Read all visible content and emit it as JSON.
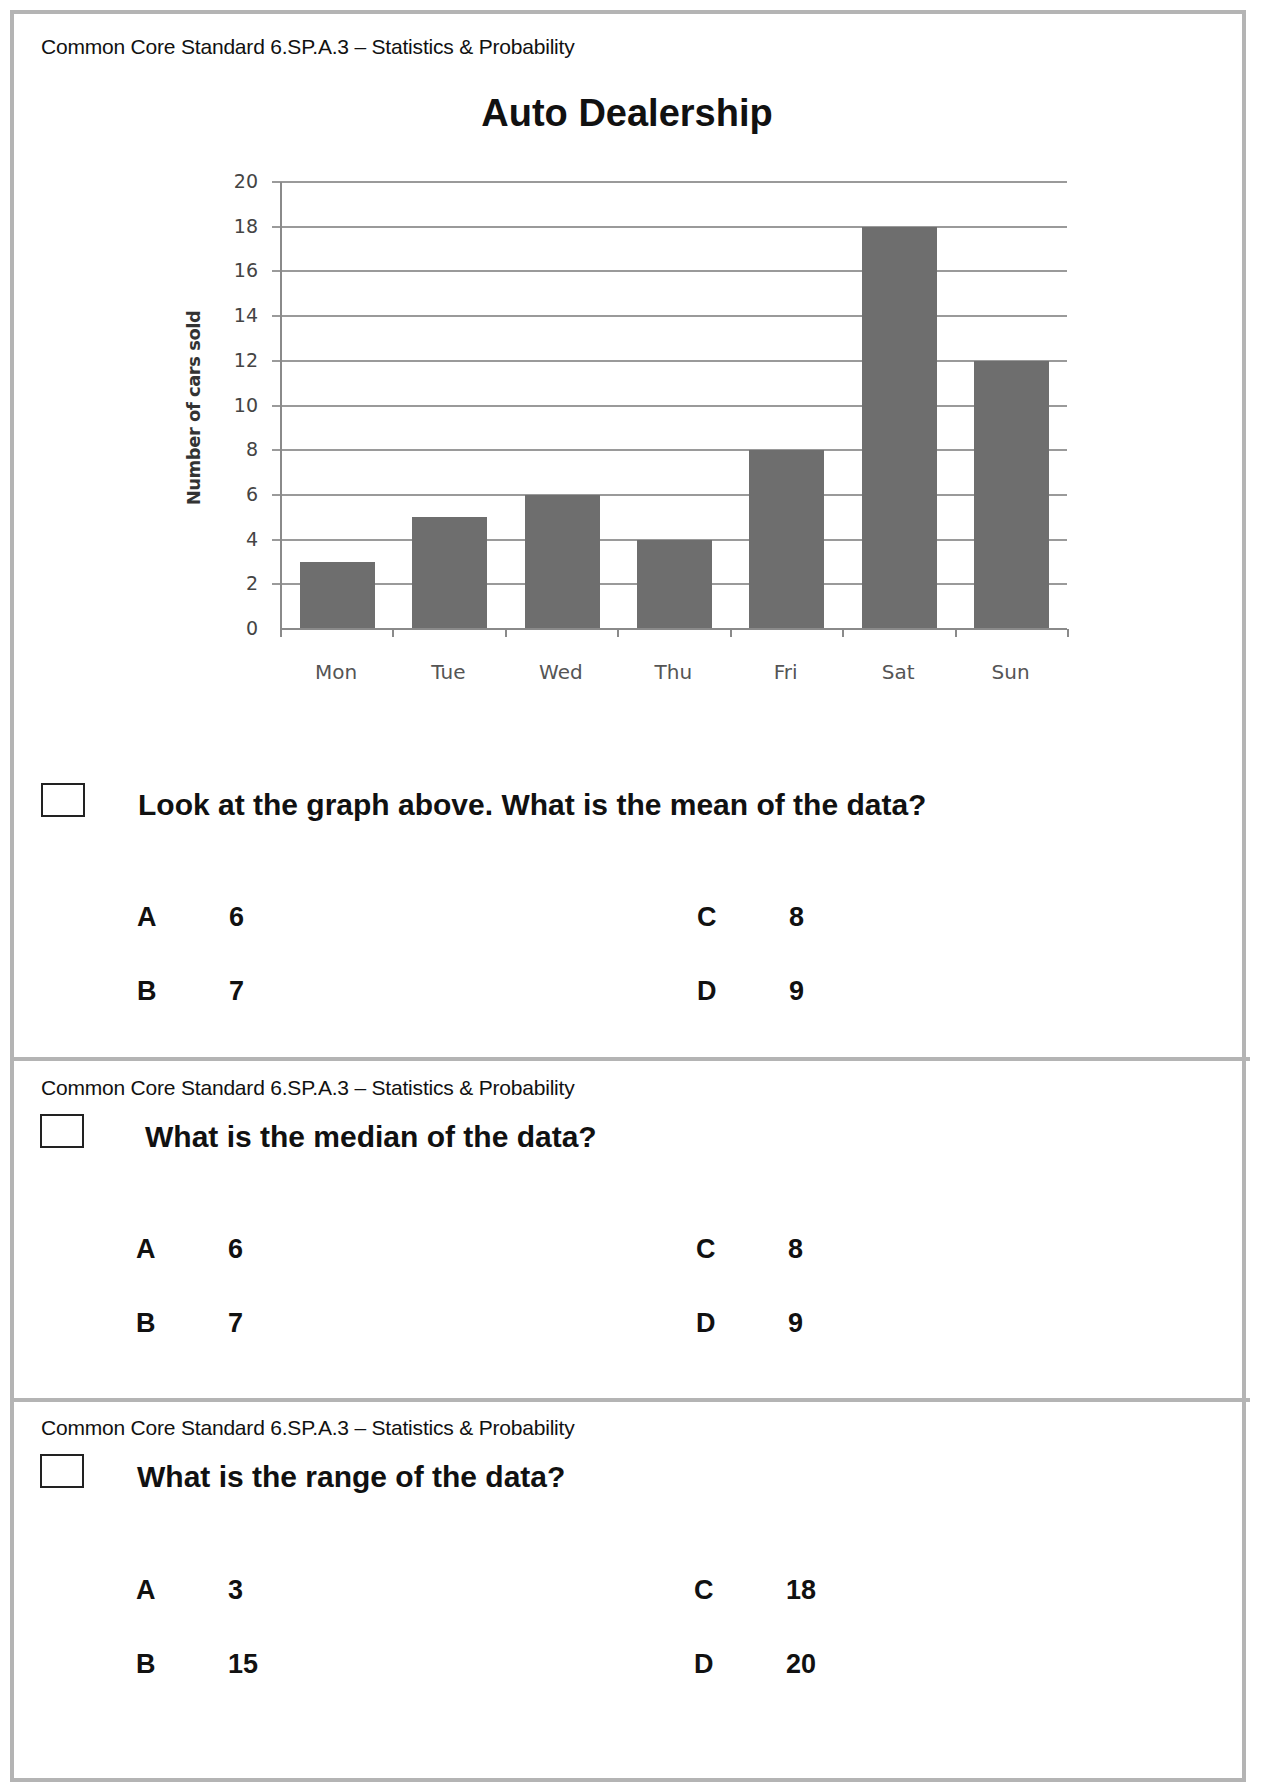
{
  "chart_data": {
    "type": "bar",
    "title": "Auto Dealership",
    "xlabel": "",
    "ylabel": "Number of cars sold",
    "categories": [
      "Mon",
      "Tue",
      "Wed",
      "Thu",
      "Fri",
      "Sat",
      "Sun"
    ],
    "values": [
      3,
      5,
      6,
      4,
      8,
      18,
      12
    ],
    "ylim": [
      0,
      20
    ],
    "yticks": [
      0,
      2,
      4,
      6,
      8,
      10,
      12,
      14,
      16,
      18,
      20
    ],
    "grid": true,
    "legend": null,
    "bar_color": "#6e6e6e"
  },
  "sections": [
    {
      "standard": "Common Core Standard 6.SP.A.3 – Statistics & Probability",
      "question": "Look at the graph above. What is the mean of the data?",
      "options": [
        {
          "letter": "A",
          "value": "6"
        },
        {
          "letter": "B",
          "value": "7"
        },
        {
          "letter": "C",
          "value": "8"
        },
        {
          "letter": "D",
          "value": "9"
        }
      ]
    },
    {
      "standard": "Common Core Standard 6.SP.A.3 – Statistics & Probability",
      "question": "What is the median of the data?",
      "options": [
        {
          "letter": "A",
          "value": "6"
        },
        {
          "letter": "B",
          "value": "7"
        },
        {
          "letter": "C",
          "value": "8"
        },
        {
          "letter": "D",
          "value": "9"
        }
      ]
    },
    {
      "standard": "Common Core Standard 6.SP.A.3 – Statistics & Probability",
      "question": "What is the range of the data?",
      "options": [
        {
          "letter": "A",
          "value": "3"
        },
        {
          "letter": "B",
          "value": "15"
        },
        {
          "letter": "C",
          "value": "18"
        },
        {
          "letter": "D",
          "value": "20"
        }
      ]
    }
  ]
}
